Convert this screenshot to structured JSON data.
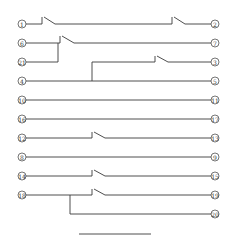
{
  "diagram": {
    "line_color": "#3a3a3a",
    "rows": [
      {
        "y": 24,
        "left": "1",
        "right": "2"
      },
      {
        "y": 43,
        "left": "6",
        "right": "7"
      },
      {
        "y": 62,
        "left": "21",
        "right": null
      },
      {
        "y": 62,
        "left": null,
        "right": "3"
      },
      {
        "y": 81,
        "left": "4",
        "right": "5"
      },
      {
        "y": 100,
        "left": "10",
        "right": "11"
      },
      {
        "y": 119,
        "left": "16",
        "right": "17"
      },
      {
        "y": 138,
        "left": "12",
        "right": "13"
      },
      {
        "y": 157,
        "left": "8",
        "right": "9"
      },
      {
        "y": 176,
        "left": "14",
        "right": "15"
      },
      {
        "y": 195,
        "left": "18",
        "right": "19"
      },
      {
        "y": 214,
        "left": null,
        "right": "20"
      }
    ],
    "terminals_left": [
      "1",
      "6",
      "21",
      "4",
      "10",
      "16",
      "12",
      "8",
      "14",
      "18"
    ],
    "terminals_right": [
      "2",
      "7",
      "3",
      "5",
      "11",
      "17",
      "13",
      "9",
      "15",
      "19",
      "20"
    ]
  }
}
